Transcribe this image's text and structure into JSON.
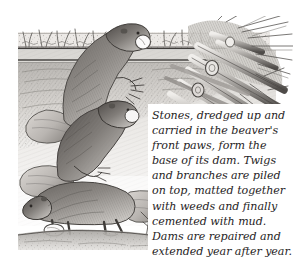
{
  "figure": {
    "caption": "Stones, dredged up and\ncarried in the beaver's\nfront paws, form the\nbase of its dam. Twigs\nand branches are piled\non top, matted together\nwith weeds and finally\ncemented with mud.\nDams are repaired and\nextended year after year.",
    "caption_lines": [
      "Stones, dredged up and",
      "carried in the beaver's",
      "front paws, form the",
      "base of its dam. Twigs",
      "and branches are piled",
      "on top, matted together",
      "with weeds and finally",
      "cemented with mud.",
      "Dams are repaired and",
      "extended year after year."
    ]
  },
  "illustration": {
    "medium": "pencil-graphite-drawing",
    "scene": "cutaway of a riverbank with beavers carrying stones to the base of a dam built of piled branches",
    "subjects": [
      {
        "name": "beaver-upper",
        "action": "climbing bank holding a pale stone in its front paws"
      },
      {
        "name": "beaver-middle",
        "action": "climbing the bank, broad flat tail trailing behind"
      },
      {
        "name": "beaver-lower",
        "action": "walking left along the ground carrying a stone"
      },
      {
        "name": "dam-branches",
        "action": "mass of cut branches and logs piled at the right"
      },
      {
        "name": "grass-bank",
        "action": "tufts of grass along the top of the bank"
      },
      {
        "name": "twig-sprig",
        "action": "small bare twig sprouting near the lower ground"
      }
    ],
    "colors": {
      "ink_dark": "#3b3836",
      "ink_mid": "#7d7a76",
      "ink_light": "#bdbab6",
      "wash_pale": "#e6e4e0",
      "paper": "#ffffff",
      "text": "#272425"
    }
  }
}
